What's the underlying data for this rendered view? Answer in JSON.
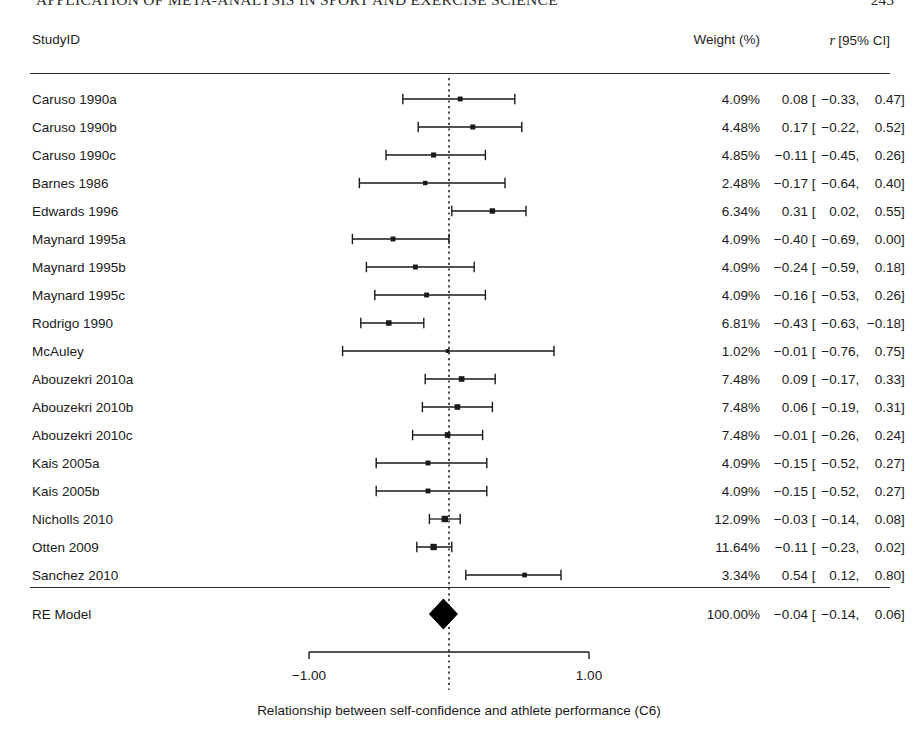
{
  "running_head": {
    "title": "APPLICATION OF META-ANALYSIS IN SPORT AND EXERCISE SCIENCE",
    "page_number": "245"
  },
  "header": {
    "studyid_label": "StudyID",
    "weight_label": "Weight (%)",
    "estimate_italic": "r",
    "estimate_label": "[95% CI]"
  },
  "caption": "Relationship between self-confidence and athlete performance (C6)",
  "axis": {
    "tick_labels": [
      "-1.00",
      "1.00"
    ],
    "tick_values": [
      -1.0,
      1.0
    ],
    "zero_reference": 0.0
  },
  "chart_data": {
    "type": "forest",
    "title": "",
    "xlabel": "Relationship between self-confidence and athlete performance (C6)",
    "ylabel": "",
    "xlim": [
      -1.0,
      1.0
    ],
    "effect_measure": "r",
    "ci_level": "95%",
    "grid": false,
    "reference_line": 0.0,
    "columns": [
      "StudyID",
      "Weight (%)",
      "r [95% CI]"
    ],
    "studies": [
      {
        "label": "Caruso 1990a",
        "weight": 4.09,
        "weight_text": "4.09%",
        "estimate": 0.08,
        "ci_low": -0.33,
        "ci_high": 0.47,
        "est_text": "0.08",
        "lo_text": "-0.33",
        "hi_text": "0.47"
      },
      {
        "label": "Caruso 1990b",
        "weight": 4.48,
        "weight_text": "4.48%",
        "estimate": 0.17,
        "ci_low": -0.22,
        "ci_high": 0.52,
        "est_text": "0.17",
        "lo_text": "-0.22",
        "hi_text": "0.52"
      },
      {
        "label": "Caruso 1990c",
        "weight": 4.85,
        "weight_text": "4.85%",
        "estimate": -0.11,
        "ci_low": -0.45,
        "ci_high": 0.26,
        "est_text": "-0.11",
        "lo_text": "-0.45",
        "hi_text": "0.26"
      },
      {
        "label": "Barnes 1986",
        "weight": 2.48,
        "weight_text": "2.48%",
        "estimate": -0.17,
        "ci_low": -0.64,
        "ci_high": 0.4,
        "est_text": "-0.17",
        "lo_text": "-0.64",
        "hi_text": "0.40"
      },
      {
        "label": "Edwards 1996",
        "weight": 6.34,
        "weight_text": "6.34%",
        "estimate": 0.31,
        "ci_low": 0.02,
        "ci_high": 0.55,
        "est_text": "0.31",
        "lo_text": "0.02",
        "hi_text": "0.55"
      },
      {
        "label": "Maynard 1995a",
        "weight": 4.09,
        "weight_text": "4.09%",
        "estimate": -0.4,
        "ci_low": -0.69,
        "ci_high": 0.0,
        "est_text": "-0.40",
        "lo_text": "-0.69",
        "hi_text": "0.00"
      },
      {
        "label": "Maynard 1995b",
        "weight": 4.09,
        "weight_text": "4.09%",
        "estimate": -0.24,
        "ci_low": -0.59,
        "ci_high": 0.18,
        "est_text": "-0.24",
        "lo_text": "-0.59",
        "hi_text": "0.18"
      },
      {
        "label": "Maynard 1995c",
        "weight": 4.09,
        "weight_text": "4.09%",
        "estimate": -0.16,
        "ci_low": -0.53,
        "ci_high": 0.26,
        "est_text": "-0.16",
        "lo_text": "-0.53",
        "hi_text": "0.26"
      },
      {
        "label": "Rodrigo 1990",
        "weight": 6.81,
        "weight_text": "6.81%",
        "estimate": -0.43,
        "ci_low": -0.63,
        "ci_high": -0.18,
        "est_text": "-0.43",
        "lo_text": "-0.63",
        "hi_text": "-0.18"
      },
      {
        "label": "McAuley",
        "weight": 1.02,
        "weight_text": "1.02%",
        "estimate": -0.01,
        "ci_low": -0.76,
        "ci_high": 0.75,
        "est_text": "-0.01",
        "lo_text": "-0.76",
        "hi_text": "0.75"
      },
      {
        "label": "Abouzekri 2010a",
        "weight": 7.48,
        "weight_text": "7.48%",
        "estimate": 0.09,
        "ci_low": -0.17,
        "ci_high": 0.33,
        "est_text": "0.09",
        "lo_text": "-0.17",
        "hi_text": "0.33"
      },
      {
        "label": "Abouzekri 2010b",
        "weight": 7.48,
        "weight_text": "7.48%",
        "estimate": 0.06,
        "ci_low": -0.19,
        "ci_high": 0.31,
        "est_text": "0.06",
        "lo_text": "-0.19",
        "hi_text": "0.31"
      },
      {
        "label": "Abouzekri 2010c",
        "weight": 7.48,
        "weight_text": "7.48%",
        "estimate": -0.01,
        "ci_low": -0.26,
        "ci_high": 0.24,
        "est_text": "-0.01",
        "lo_text": "-0.26",
        "hi_text": "0.24"
      },
      {
        "label": "Kais 2005a",
        "weight": 4.09,
        "weight_text": "4.09%",
        "estimate": -0.15,
        "ci_low": -0.52,
        "ci_high": 0.27,
        "est_text": "-0.15",
        "lo_text": "-0.52",
        "hi_text": "0.27"
      },
      {
        "label": "Kais 2005b",
        "weight": 4.09,
        "weight_text": "4.09%",
        "estimate": -0.15,
        "ci_low": -0.52,
        "ci_high": 0.27,
        "est_text": "-0.15",
        "lo_text": "-0.52",
        "hi_text": "0.27"
      },
      {
        "label": "Nicholls 2010",
        "weight": 12.09,
        "weight_text": "12.09%",
        "estimate": -0.03,
        "ci_low": -0.14,
        "ci_high": 0.08,
        "est_text": "-0.03",
        "lo_text": "-0.14",
        "hi_text": "0.08"
      },
      {
        "label": "Otten 2009",
        "weight": 11.64,
        "weight_text": "11.64%",
        "estimate": -0.11,
        "ci_low": -0.23,
        "ci_high": 0.02,
        "est_text": "-0.11",
        "lo_text": "-0.23",
        "hi_text": "0.02"
      },
      {
        "label": "Sanchez 2010",
        "weight": 3.34,
        "weight_text": "3.34%",
        "estimate": 0.54,
        "ci_low": 0.12,
        "ci_high": 0.8,
        "est_text": "0.54",
        "lo_text": "0.12",
        "hi_text": "0.80"
      }
    ],
    "summary": {
      "label": "RE Model",
      "weight": 100.0,
      "weight_text": "100.00%",
      "estimate": -0.04,
      "ci_low": -0.14,
      "ci_high": 0.06,
      "est_text": "-0.04",
      "lo_text": "-0.14",
      "hi_text": "0.06"
    }
  }
}
